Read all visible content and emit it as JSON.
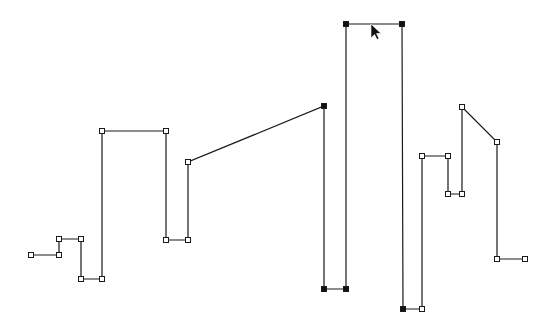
{
  "diagram": {
    "type": "polyline-path-editor",
    "stroke_color": "#1a1a1a",
    "handle_fill_open": "#ffffff",
    "handle_fill_selected": "#111111",
    "points": [
      {
        "x": 31,
        "y": 255,
        "selected": false
      },
      {
        "x": 59,
        "y": 255,
        "selected": false
      },
      {
        "x": 59,
        "y": 239,
        "selected": false
      },
      {
        "x": 81,
        "y": 239,
        "selected": false
      },
      {
        "x": 81,
        "y": 279,
        "selected": false
      },
      {
        "x": 102,
        "y": 279,
        "selected": false
      },
      {
        "x": 102,
        "y": 131,
        "selected": false
      },
      {
        "x": 166,
        "y": 131,
        "selected": false
      },
      {
        "x": 166,
        "y": 240,
        "selected": false
      },
      {
        "x": 188,
        "y": 240,
        "selected": false
      },
      {
        "x": 188,
        "y": 162,
        "selected": false
      },
      {
        "x": 324,
        "y": 106,
        "selected": true
      },
      {
        "x": 324,
        "y": 289,
        "selected": true
      },
      {
        "x": 346,
        "y": 289,
        "selected": true
      },
      {
        "x": 346,
        "y": 24,
        "selected": true
      },
      {
        "x": 402,
        "y": 24,
        "selected": true
      },
      {
        "x": 403,
        "y": 309,
        "selected": true
      },
      {
        "x": 422,
        "y": 309,
        "selected": false
      },
      {
        "x": 422,
        "y": 156,
        "selected": false
      },
      {
        "x": 448,
        "y": 156,
        "selected": false
      },
      {
        "x": 448,
        "y": 194,
        "selected": false
      },
      {
        "x": 462,
        "y": 194,
        "selected": false
      },
      {
        "x": 462,
        "y": 107,
        "selected": false
      },
      {
        "x": 497,
        "y": 142,
        "selected": false
      },
      {
        "x": 497,
        "y": 259,
        "selected": false
      },
      {
        "x": 525,
        "y": 259,
        "selected": false
      }
    ],
    "cursor": {
      "x": 371,
      "y": 24,
      "icon": "arrow-pointer-icon"
    }
  }
}
